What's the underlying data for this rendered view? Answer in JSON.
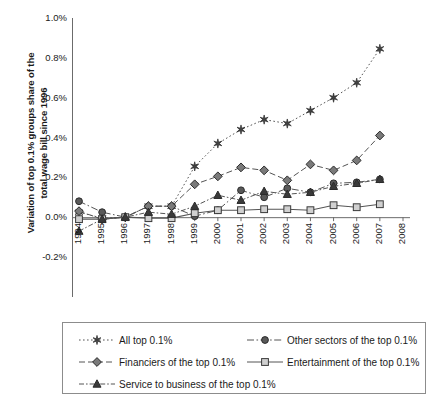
{
  "chart_data": {
    "type": "line",
    "title": "",
    "xlabel": "",
    "ylabel": "Variation of top 0.1% groups share of the total wage bill since 1996",
    "ylabel_line1": "Variation of top 0.1% groups share of the",
    "ylabel_line2": "total wage bill since 1996",
    "x": [
      1994,
      1995,
      1996,
      1997,
      1998,
      1999,
      2000,
      2001,
      2002,
      2003,
      2004,
      2005,
      2006,
      2007
    ],
    "xticklabels": [
      "1994",
      "1995",
      "1996",
      "1997",
      "1998",
      "1999",
      "2000",
      "2001",
      "2002",
      "2003",
      "2004",
      "2005",
      "2006",
      "2007",
      "2008"
    ],
    "xticks": [
      1994,
      1995,
      1996,
      1997,
      1998,
      1999,
      2000,
      2001,
      2002,
      2003,
      2004,
      2005,
      2006,
      2007,
      2008
    ],
    "yticklabels": [
      "1.0%",
      "0.8%",
      "0.6%",
      "0.4%",
      "0.2%",
      "0.0%",
      "-0.2%"
    ],
    "yticks": [
      1.0,
      0.8,
      0.6,
      0.4,
      0.2,
      0.0,
      -0.2
    ],
    "ylim": [
      -0.2,
      1.0
    ],
    "xlim": [
      1994,
      2008
    ],
    "grid": false,
    "legend_position": "below",
    "series": [
      {
        "name": "All top 0.1%",
        "marker": "star",
        "linestyle": "dotted",
        "color": "#404040",
        "values": [
          0.025,
          -0.005,
          0.0,
          0.055,
          0.055,
          0.255,
          0.37,
          0.44,
          0.49,
          0.47,
          0.535,
          0.6,
          0.675,
          0.845
        ]
      },
      {
        "name": "Other sectors of the top 0.1%",
        "marker": "circle",
        "linestyle": "dashdot",
        "color": "#595959",
        "values": [
          0.08,
          0.025,
          0.0,
          0.055,
          0.055,
          0.005,
          0.035,
          0.135,
          0.1,
          0.145,
          0.125,
          0.17,
          0.175,
          0.19
        ]
      },
      {
        "name": "Financiers of the top 0.1%",
        "marker": "diamond",
        "linestyle": "dashed",
        "color": "#7a7a7a",
        "values": [
          0.03,
          -0.01,
          0.0,
          0.055,
          0.055,
          0.165,
          0.205,
          0.25,
          0.235,
          0.185,
          0.265,
          0.235,
          0.285,
          0.41
        ]
      },
      {
        "name": "Entertainment of the top 0.1%",
        "marker": "square",
        "linestyle": "solid",
        "color": "#9e9e9e",
        "values": [
          -0.01,
          -0.01,
          0.0,
          -0.005,
          -0.005,
          0.02,
          0.035,
          0.035,
          0.04,
          0.04,
          0.035,
          0.06,
          0.05,
          0.065
        ]
      },
      {
        "name": "Service to business of the top 0.1%",
        "marker": "triangle",
        "linestyle": "dashdotted",
        "color": "#3a3a3a",
        "values": [
          -0.07,
          -0.01,
          0.0,
          0.025,
          0.015,
          0.055,
          0.11,
          0.085,
          0.13,
          0.115,
          0.125,
          0.155,
          0.17,
          0.19
        ]
      }
    ]
  },
  "legend": {
    "entries": [
      "All top 0.1%",
      "Other sectors of the top 0.1%",
      "Financiers of the top 0.1%",
      "Entertainment of the top 0.1%",
      "Service to business of the top 0.1%"
    ]
  }
}
